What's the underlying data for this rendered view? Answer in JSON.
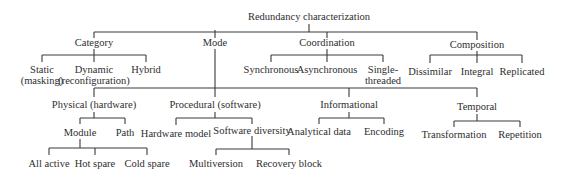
{
  "diagram": {
    "type": "tree",
    "line_color": "#3a3a3a",
    "text_color": "#2e2e2e",
    "root": {
      "label": "Redundancy characterization"
    },
    "nodes": {
      "category": {
        "label": "Category"
      },
      "mode": {
        "label": "Mode"
      },
      "coordination": {
        "label": "Coordination"
      },
      "composition": {
        "label": "Composition"
      },
      "static": {
        "line1": "Static",
        "line2": "(masking)"
      },
      "dynamic": {
        "line1": "Dynamic",
        "line2": "(reconfiguration)"
      },
      "hybrid": {
        "label": "Hybrid"
      },
      "synchronous": {
        "label": "Synchronous"
      },
      "asynchronous": {
        "label": "Asynchronous"
      },
      "single_threaded": {
        "line1": "Single-",
        "line2": "threaded"
      },
      "dissimilar": {
        "label": "Dissimilar"
      },
      "integral": {
        "label": "Integral"
      },
      "replicated": {
        "label": "Replicated"
      },
      "physical": {
        "label": "Physical (hardware)"
      },
      "procedural": {
        "label": "Procedural (software)"
      },
      "informational": {
        "label": "Informational"
      },
      "temporal": {
        "label": "Temporal"
      },
      "module": {
        "label": "Module"
      },
      "path": {
        "label": "Path"
      },
      "hardware_model": {
        "label": "Hardware model"
      },
      "software_diversity": {
        "label": "Software diversity"
      },
      "analytical_data": {
        "label": "Analytical data"
      },
      "encoding": {
        "label": "Encoding"
      },
      "transformation": {
        "label": "Transformation"
      },
      "repetition": {
        "label": "Repetition"
      },
      "all_active": {
        "label": "All active"
      },
      "hot_spare": {
        "label": "Hot spare"
      },
      "cold_spare": {
        "label": "Cold spare"
      },
      "multiversion": {
        "label": "Multiversion"
      },
      "recovery_block": {
        "label": "Recovery block"
      }
    },
    "edges": [
      [
        "Redundancy characterization",
        "Category"
      ],
      [
        "Redundancy characterization",
        "Mode"
      ],
      [
        "Redundancy characterization",
        "Coordination"
      ],
      [
        "Redundancy characterization",
        "Composition"
      ],
      [
        "Category",
        "Static (masking)"
      ],
      [
        "Category",
        "Dynamic (reconfiguration)"
      ],
      [
        "Category",
        "Hybrid"
      ],
      [
        "Coordination",
        "Synchronous"
      ],
      [
        "Coordination",
        "Asynchronous"
      ],
      [
        "Coordination",
        "Single-threaded"
      ],
      [
        "Composition",
        "Dissimilar"
      ],
      [
        "Composition",
        "Integral"
      ],
      [
        "Composition",
        "Replicated"
      ],
      [
        "Mode",
        "Physical (hardware)"
      ],
      [
        "Mode",
        "Procedural (software)"
      ],
      [
        "Mode",
        "Informational"
      ],
      [
        "Mode",
        "Temporal"
      ],
      [
        "Physical (hardware)",
        "Module"
      ],
      [
        "Physical (hardware)",
        "Path"
      ],
      [
        "Module",
        "All active"
      ],
      [
        "Module",
        "Hot spare"
      ],
      [
        "Module",
        "Cold spare"
      ],
      [
        "Procedural (software)",
        "Hardware model"
      ],
      [
        "Procedural (software)",
        "Software diversity"
      ],
      [
        "Software diversity",
        "Multiversion"
      ],
      [
        "Software diversity",
        "Recovery block"
      ],
      [
        "Informational",
        "Analytical data"
      ],
      [
        "Informational",
        "Encoding"
      ],
      [
        "Temporal",
        "Transformation"
      ],
      [
        "Temporal",
        "Repetition"
      ]
    ]
  }
}
